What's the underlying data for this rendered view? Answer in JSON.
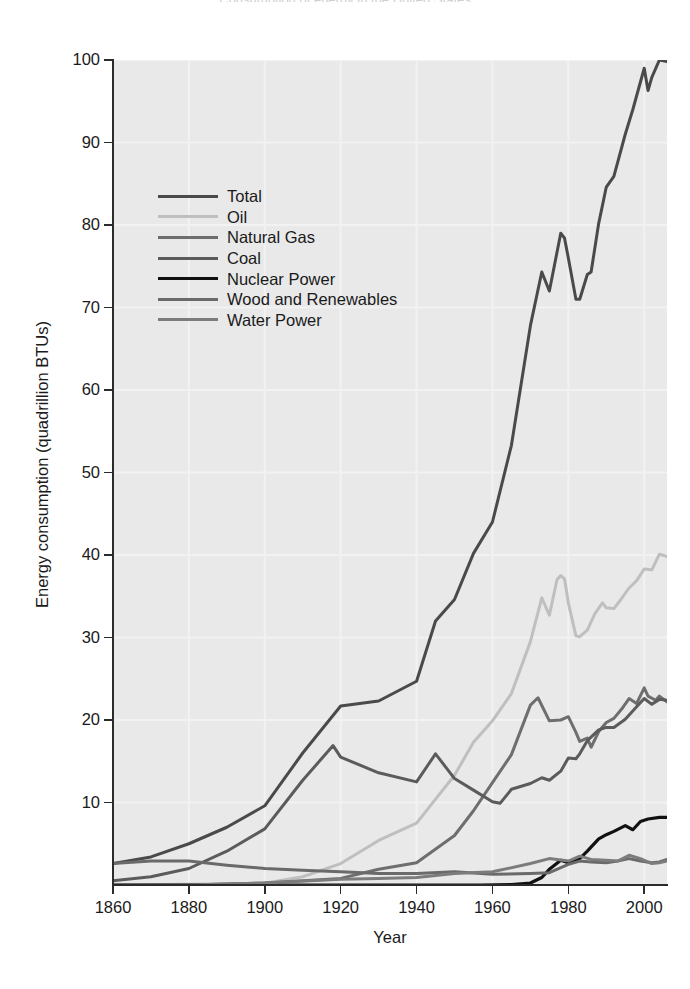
{
  "chart_data": {
    "type": "line",
    "title": "Consumption of energy in the United States",
    "xlabel": "Year",
    "ylabel": "Energy consumption (quadrillion BTUs)",
    "xlim": [
      1860,
      2006
    ],
    "ylim": [
      0,
      100
    ],
    "xticks": [
      1860,
      1880,
      1900,
      1920,
      1940,
      1960,
      1980,
      2000
    ],
    "yticks": [
      0,
      10,
      20,
      30,
      40,
      50,
      60,
      70,
      80,
      90,
      100
    ],
    "xtick_labels": [
      "1860",
      "1880",
      "1900",
      "1920",
      "1940",
      "1960",
      "1980",
      "2000"
    ],
    "ytick_labels": [
      "10",
      "20",
      "30",
      "40",
      "50",
      "60",
      "70",
      "80",
      "90",
      "100"
    ],
    "grid": true,
    "legend_position": "upper-left-inside",
    "plot_background": "#e9e9e9",
    "gridline_color": "#f2f2f2",
    "series": [
      {
        "name": "Total",
        "color": "#4a4a4a",
        "width": 3.0,
        "x": [
          1860,
          1870,
          1880,
          1890,
          1900,
          1910,
          1920,
          1930,
          1940,
          1945,
          1950,
          1955,
          1960,
          1965,
          1970,
          1973,
          1975,
          1978,
          1979,
          1980,
          1982,
          1983,
          1985,
          1986,
          1988,
          1990,
          1992,
          1995,
          1997,
          2000,
          2001,
          2002,
          2004,
          2006
        ],
        "y": [
          2.6,
          3.4,
          5.0,
          7.0,
          9.6,
          16.0,
          21.7,
          22.3,
          24.7,
          32.0,
          34.6,
          40.2,
          44.0,
          53.3,
          67.8,
          74.3,
          72.0,
          79.0,
          78.4,
          76.0,
          71.0,
          71.0,
          74.0,
          74.3,
          80.2,
          84.6,
          85.9,
          91.0,
          94.0,
          99.0,
          96.3,
          97.9,
          100.0,
          99.8
        ]
      },
      {
        "name": "Oil",
        "color": "#bfbfbf",
        "width": 3.0,
        "x": [
          1860,
          1880,
          1900,
          1910,
          1920,
          1930,
          1940,
          1950,
          1955,
          1960,
          1965,
          1970,
          1973,
          1975,
          1977,
          1978,
          1979,
          1980,
          1982,
          1983,
          1985,
          1987,
          1989,
          1990,
          1992,
          1994,
          1996,
          1998,
          2000,
          2002,
          2004,
          2006
        ],
        "y": [
          0.0,
          0.1,
          0.2,
          1.0,
          2.6,
          5.4,
          7.5,
          13.3,
          17.3,
          19.9,
          23.2,
          29.5,
          34.8,
          32.7,
          37.0,
          37.5,
          37.1,
          34.2,
          30.2,
          30.1,
          30.9,
          32.9,
          34.2,
          33.6,
          33.5,
          34.7,
          36.0,
          36.9,
          38.3,
          38.2,
          40.1,
          39.8
        ]
      },
      {
        "name": "Natural Gas",
        "color": "#6e6e6e",
        "width": 3.0,
        "x": [
          1860,
          1880,
          1900,
          1920,
          1930,
          1940,
          1950,
          1955,
          1960,
          1965,
          1970,
          1972,
          1975,
          1978,
          1980,
          1982,
          1983,
          1985,
          1986,
          1988,
          1990,
          1992,
          1994,
          1996,
          1998,
          2000,
          2001,
          2003,
          2004,
          2006
        ],
        "y": [
          0.0,
          0.0,
          0.25,
          0.8,
          1.9,
          2.7,
          6.0,
          9.0,
          12.4,
          15.8,
          21.8,
          22.7,
          19.9,
          20.0,
          20.4,
          18.5,
          17.4,
          17.8,
          16.7,
          18.6,
          19.7,
          20.2,
          21.3,
          22.6,
          22.0,
          23.9,
          22.9,
          22.4,
          22.9,
          22.2
        ]
      },
      {
        "name": "Coal",
        "color": "#5b5b5b",
        "width": 3.0,
        "x": [
          1860,
          1870,
          1880,
          1890,
          1900,
          1910,
          1918,
          1920,
          1930,
          1940,
          1945,
          1950,
          1955,
          1960,
          1962,
          1965,
          1970,
          1973,
          1975,
          1978,
          1980,
          1982,
          1983,
          1985,
          1988,
          1990,
          1992,
          1995,
          1998,
          2000,
          2002,
          2004,
          2006
        ],
        "y": [
          0.5,
          1.0,
          2.0,
          4.1,
          6.8,
          12.7,
          16.9,
          15.5,
          13.6,
          12.5,
          15.9,
          12.9,
          11.5,
          10.1,
          9.9,
          11.6,
          12.3,
          13.0,
          12.7,
          13.8,
          15.4,
          15.3,
          15.9,
          17.5,
          18.8,
          19.1,
          19.1,
          20.1,
          21.6,
          22.6,
          21.9,
          22.5,
          22.4
        ]
      },
      {
        "name": "Nuclear Power",
        "color": "#111111",
        "width": 3.2,
        "x": [
          1860,
          1957,
          1965,
          1970,
          1973,
          1975,
          1978,
          1980,
          1983,
          1985,
          1988,
          1990,
          1992,
          1995,
          1997,
          1999,
          2001,
          2004,
          2006
        ],
        "y": [
          0.0,
          0.0,
          0.04,
          0.24,
          0.91,
          1.9,
          3.0,
          2.7,
          3.2,
          4.1,
          5.6,
          6.1,
          6.5,
          7.2,
          6.7,
          7.7,
          8.0,
          8.2,
          8.2
        ]
      },
      {
        "name": "Wood and Renewables",
        "color": "#6a6a6a",
        "width": 3.0,
        "x": [
          1860,
          1870,
          1880,
          1890,
          1900,
          1910,
          1920,
          1930,
          1940,
          1950,
          1960,
          1970,
          1975,
          1980,
          1983,
          1986,
          1990,
          1993,
          1996,
          1999,
          2002,
          2004,
          2006
        ],
        "y": [
          2.6,
          2.9,
          2.9,
          2.4,
          2.0,
          1.8,
          1.6,
          1.4,
          1.4,
          1.6,
          1.3,
          1.4,
          1.5,
          2.5,
          2.9,
          2.8,
          2.7,
          2.9,
          3.2,
          2.9,
          2.7,
          2.8,
          3.1
        ]
      },
      {
        "name": "Water Power",
        "color": "#7c7c7c",
        "width": 3.0,
        "x": [
          1860,
          1880,
          1900,
          1920,
          1930,
          1940,
          1950,
          1960,
          1970,
          1975,
          1980,
          1983,
          1986,
          1990,
          1993,
          1996,
          1999,
          2002,
          2004,
          2006
        ],
        "y": [
          0.0,
          0.0,
          0.25,
          0.7,
          0.8,
          0.9,
          1.4,
          1.6,
          2.6,
          3.2,
          2.9,
          3.5,
          3.1,
          3.0,
          2.9,
          3.6,
          3.2,
          2.6,
          2.7,
          2.9
        ]
      }
    ],
    "legend": [
      {
        "label": "Total",
        "color": "#4a4a4a"
      },
      {
        "label": "Oil",
        "color": "#bfbfbf"
      },
      {
        "label": "Natural Gas",
        "color": "#6e6e6e"
      },
      {
        "label": "Coal",
        "color": "#5b5b5b"
      },
      {
        "label": "Nuclear Power",
        "color": "#111111"
      },
      {
        "label": "Wood and Renewables",
        "color": "#6a6a6a"
      },
      {
        "label": "Water Power",
        "color": "#7c7c7c"
      }
    ]
  }
}
